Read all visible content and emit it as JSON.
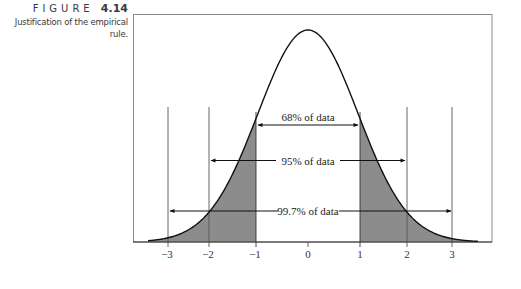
{
  "caption": {
    "figure_word": "FIGURE",
    "figure_number": "4.14",
    "description": "Justification of the empirical rule."
  },
  "chart_data": {
    "type": "area",
    "title": "Justification of the empirical rule.",
    "xlabel": "",
    "ylabel": "",
    "x_ticks": [
      -3,
      -2,
      -1,
      0,
      1,
      2,
      3
    ],
    "x_tick_labels": [
      "−3",
      "−2",
      "−1",
      "0",
      "1",
      "2",
      "3"
    ],
    "curve": "standard normal density",
    "shaded_regions": [
      {
        "from": -3.5,
        "to": -1,
        "color": "#8c8c8c"
      },
      {
        "from": 1,
        "to": 3.5,
        "color": "#8c8c8c"
      }
    ],
    "vertical_lines_at": [
      -3,
      -2,
      -1,
      1,
      2,
      3
    ],
    "annotations": [
      {
        "text": "68% of data",
        "from": -1,
        "to": 1
      },
      {
        "text": "95% of data",
        "from": -2,
        "to": 2
      },
      {
        "text": "99.7% of data",
        "from": -3,
        "to": 3
      }
    ],
    "grid": false,
    "legend": null
  },
  "labels": {
    "ann68": "68% of data",
    "ann95": "95% of data",
    "ann997": "99.7% of data",
    "t_m3": "−3",
    "t_m2": "−2",
    "t_m1": "−1",
    "t_0": "0",
    "t_1": "1",
    "t_2": "2",
    "t_3": "3"
  }
}
